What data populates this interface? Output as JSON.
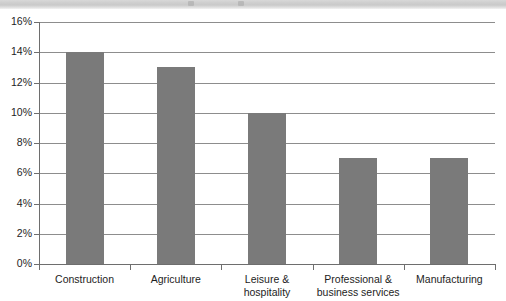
{
  "chart_data": {
    "type": "bar",
    "title": "",
    "subtitle": "",
    "xlabel": "",
    "ylabel": "",
    "categories": [
      "Construction",
      "Agriculture",
      "Leisure &\nhospitality",
      "Professional &\nbusiness services",
      "Manufacturing"
    ],
    "values": [
      14,
      13,
      10,
      7,
      7
    ],
    "value_suffix": "%",
    "ylim": [
      0,
      16
    ],
    "ytick_step": 2,
    "ytick_labels": [
      "0%",
      "2%",
      "4%",
      "6%",
      "8%",
      "10%",
      "12%",
      "14%",
      "16%"
    ],
    "ytick_values": [
      0,
      2,
      4,
      6,
      8,
      10,
      12,
      14,
      16
    ],
    "grid": true,
    "grid_axis": "y",
    "legend": false,
    "legend_position": "none",
    "series": [
      {
        "name": "",
        "values": [
          14,
          13,
          10,
          7,
          7
        ]
      }
    ]
  },
  "style": {
    "bar_color": "#7a7a7a",
    "gridline_color": "#8d8d8d",
    "axis_color": "#6e6e6e",
    "text_color": "#1d1d1d",
    "background": "#ffffff",
    "artifact_band_color": "#cfcfcf"
  },
  "artifact": {
    "description": "scan-artifact-band"
  }
}
